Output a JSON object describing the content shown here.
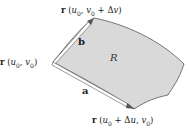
{
  "diagram": {
    "type": "surface-patch-parallelogram",
    "labels": {
      "top_corner": "r (u₀, v₀ + Δv)",
      "left_corner": "r (u₀, v₀)",
      "bottom_corner": "r (u₀ + Δu, v₀)",
      "vector_b": "b",
      "vector_a": "a",
      "region": "R"
    },
    "colors": {
      "surface_fill": "#d9d9d9",
      "surface_edge": "#555555",
      "vector_fill": "#ffffff",
      "text": "#222222"
    }
  }
}
